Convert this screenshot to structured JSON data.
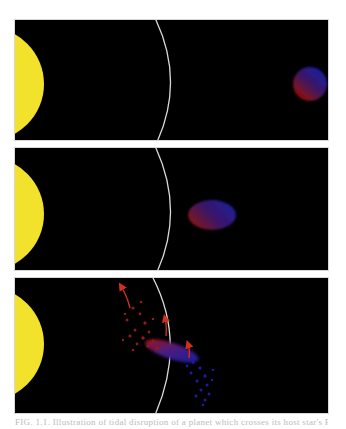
{
  "figure": {
    "panels": [
      {
        "id": "panel-1",
        "description": "Planet far from star, spherical",
        "star_color": "#f2e22c",
        "planet_shape": "sphere"
      },
      {
        "id": "panel-2",
        "description": "Planet approaching star, tidally elongated",
        "star_color": "#f2e22c",
        "planet_shape": "ellipsoid"
      },
      {
        "id": "panel-3",
        "description": "Planet crossing Roche limit, tidally disrupted into debris stream",
        "star_color": "#f2e22c",
        "planet_shape": "disrupted",
        "arrows": 3
      }
    ],
    "colors": {
      "background": "#000000",
      "star": "#f2e22c",
      "roche_limit_line": "#d9d9d9",
      "planet_near_side": "#8a1010",
      "planet_far_side": "#1c1c9a",
      "arrow": "#d0301c"
    },
    "caption": "FIG. 1.1. Illustration of tidal disruption of a planet which crosses its host star's Roche limit..."
  }
}
